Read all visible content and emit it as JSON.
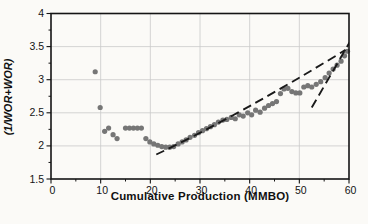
{
  "figure": {
    "background": "#fbfaf7"
  },
  "chart_data": {
    "type": "scatter",
    "title": "",
    "xlabel": "Cumulative Production (MMBO)",
    "ylabel": "(1/WOR+WOR)",
    "xlim": [
      0,
      60
    ],
    "ylim": [
      1.5,
      4
    ],
    "x_ticks": [
      {
        "value": 0,
        "label": "0"
      },
      {
        "value": 10,
        "label": "10"
      },
      {
        "value": 20,
        "label": "20"
      },
      {
        "value": 30,
        "label": "30"
      },
      {
        "value": 40,
        "label": "40"
      },
      {
        "value": 50,
        "label": "50"
      },
      {
        "value": 60,
        "label": "60"
      }
    ],
    "y_ticks": [
      {
        "value": 1.5,
        "label": "1.5"
      },
      {
        "value": 2,
        "label": "2"
      },
      {
        "value": 2.5,
        "label": "2.5"
      },
      {
        "value": 3,
        "label": "3"
      },
      {
        "value": 3.5,
        "label": "3.5"
      },
      {
        "value": 4,
        "label": "4"
      }
    ],
    "x_minor_step": 5,
    "y_minor_step": 0.25,
    "grid": "major",
    "grid_color": "#c9c9c9",
    "axis_color": "#141414",
    "point_color": "#767676",
    "point_radius": 2.6,
    "points": [
      [
        8.9,
        3.12
      ],
      [
        9.9,
        2.58
      ],
      [
        10.8,
        2.22
      ],
      [
        11.6,
        2.27
      ],
      [
        12.5,
        2.17
      ],
      [
        13.3,
        2.11
      ],
      [
        15.0,
        2.27
      ],
      [
        15.8,
        2.27
      ],
      [
        16.6,
        2.27
      ],
      [
        17.4,
        2.27
      ],
      [
        18.2,
        2.27
      ],
      [
        19.1,
        2.11
      ],
      [
        19.9,
        2.06
      ],
      [
        20.7,
        2.03
      ],
      [
        21.5,
        2.01
      ],
      [
        22.3,
        1.99
      ],
      [
        23.1,
        1.98
      ],
      [
        23.9,
        1.98
      ],
      [
        24.7,
        1.99
      ],
      [
        25.6,
        2.03
      ],
      [
        26.4,
        2.06
      ],
      [
        27.2,
        2.09
      ],
      [
        28.0,
        2.13
      ],
      [
        28.9,
        2.16
      ],
      [
        29.7,
        2.2
      ],
      [
        30.5,
        2.23
      ],
      [
        31.3,
        2.26
      ],
      [
        32.1,
        2.29
      ],
      [
        32.9,
        2.32
      ],
      [
        33.7,
        2.36
      ],
      [
        34.6,
        2.39
      ],
      [
        35.4,
        2.4
      ],
      [
        36.3,
        2.43
      ],
      [
        37.1,
        2.41
      ],
      [
        37.9,
        2.47
      ],
      [
        38.7,
        2.45
      ],
      [
        39.6,
        2.5
      ],
      [
        40.4,
        2.47
      ],
      [
        41.2,
        2.54
      ],
      [
        42.1,
        2.51
      ],
      [
        43.0,
        2.57
      ],
      [
        43.8,
        2.61
      ],
      [
        44.6,
        2.64
      ],
      [
        45.4,
        2.67
      ],
      [
        46.2,
        2.79
      ],
      [
        46.9,
        2.86
      ],
      [
        47.7,
        2.87
      ],
      [
        48.5,
        2.82
      ],
      [
        49.3,
        2.8
      ],
      [
        50.1,
        2.8
      ],
      [
        50.9,
        2.89
      ],
      [
        51.7,
        2.91
      ],
      [
        52.5,
        2.89
      ],
      [
        53.4,
        2.93
      ],
      [
        54.3,
        2.97
      ],
      [
        55.2,
        3.03
      ],
      [
        56.0,
        3.1
      ],
      [
        56.8,
        3.16
      ],
      [
        57.6,
        3.22
      ],
      [
        58.4,
        3.28
      ],
      [
        59.1,
        3.36
      ],
      [
        59.7,
        3.43
      ]
    ],
    "trend_lines": [
      {
        "name": "main-decline-trend-dashed",
        "shape": "quadratic",
        "from": [
          21.2,
          1.87
        ],
        "control": [
          38.0,
          2.47
        ],
        "to": [
          59.3,
          3.45
        ],
        "color": "#1a1a1a",
        "dash": "9 5",
        "width": 1.9
      },
      {
        "name": "late-steep-trend-dashed",
        "shape": "line",
        "from": [
          52.5,
          2.58
        ],
        "to": [
          60.4,
          3.6
        ],
        "color": "#1a1a1a",
        "dash": "9 5",
        "width": 1.9
      }
    ]
  }
}
